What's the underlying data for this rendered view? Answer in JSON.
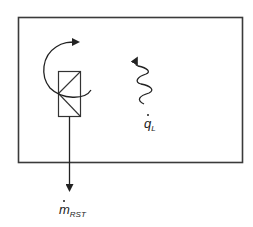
{
  "diagram": {
    "type": "control-volume schematic",
    "system_boundary": {
      "shape": "rectangle",
      "stroke": "#333333"
    },
    "valve": {
      "shape": "rectangle with diagonal lines",
      "stroke": "#333333"
    },
    "rotation_arrow": {
      "direction": "clockwise",
      "stroke": "#222222"
    },
    "heat_flow": {
      "symbol": "q",
      "subscript": "L",
      "dot": true,
      "arrow_style": "wavy",
      "direction": "up"
    },
    "mass_flow": {
      "symbol": "m",
      "subscript": "RST",
      "dot": true,
      "arrow_style": "straight",
      "direction": "down"
    }
  }
}
